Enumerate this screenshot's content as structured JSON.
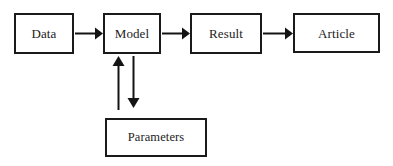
{
  "diagram": {
    "background_color": "#ffffff",
    "stroke_color": "#141414",
    "nodes": [
      {
        "id": "data",
        "label": "Data",
        "shape": "rectangle",
        "x": 14,
        "y": 13,
        "width": 60,
        "height": 41
      },
      {
        "id": "model",
        "label": "Model",
        "shape": "rectangle",
        "x": 103,
        "y": 13,
        "width": 58,
        "height": 41
      },
      {
        "id": "result",
        "label": "Result",
        "shape": "rectangle",
        "x": 190,
        "y": 13,
        "width": 72,
        "height": 41
      },
      {
        "id": "article",
        "label": "Article",
        "shape": "rectangle",
        "x": 293,
        "y": 13,
        "width": 87,
        "height": 40
      },
      {
        "id": "parameters",
        "label": "Parameters",
        "shape": "rectangle",
        "x": 105,
        "y": 118,
        "width": 102,
        "height": 39
      }
    ],
    "edges": [
      {
        "id": "data-to-model",
        "from": "data",
        "to": "model",
        "direction": "right"
      },
      {
        "id": "model-to-result",
        "from": "model",
        "to": "result",
        "direction": "right"
      },
      {
        "id": "result-to-article",
        "from": "result",
        "to": "article",
        "direction": "right"
      },
      {
        "id": "parameters-to-model",
        "from": "parameters",
        "to": "model",
        "direction": "up"
      },
      {
        "id": "model-to-parameters",
        "from": "model",
        "to": "parameters",
        "direction": "down"
      }
    ]
  }
}
